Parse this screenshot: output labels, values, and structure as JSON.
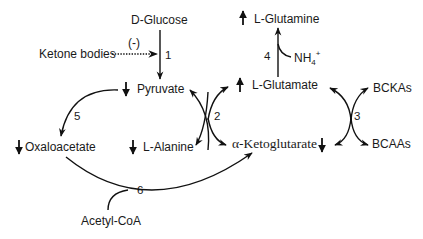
{
  "nodes": {
    "d_glucose": "D-Glucose",
    "ketone_bodies": "Ketone bodies",
    "inhibition": "(-)",
    "pyruvate": "Pyruvate",
    "oxaloacetate": "Oxaloacetate",
    "l_alanine": "L-Alanine",
    "l_glutamine": "L-Glutamine",
    "l_glutamate": "L-Glutamate",
    "nh4": "NH",
    "nh4_sub": "4",
    "nh4_sup": "+",
    "alpha_ketoglutarate": "α-Ketoglutarate",
    "bckas": "BCKAs",
    "bcaas": "BCAAs",
    "acetyl_coa": "Acetyl-CoA"
  },
  "reactions": {
    "r1": "1",
    "r2": "2",
    "r3": "3",
    "r4": "4",
    "r5": "5",
    "r6": "6"
  },
  "indicators": {
    "pyruvate": "down",
    "oxaloacetate": "down",
    "l_alanine": "down",
    "alpha_ketoglutarate": "down",
    "l_glutamine": "up",
    "l_glutamate": "up"
  }
}
